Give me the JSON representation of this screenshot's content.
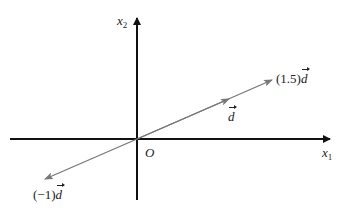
{
  "diagram": {
    "colors": {
      "axis": "#111111",
      "vector": "#777777",
      "text": "#222222"
    },
    "origin": {
      "px": [
        137,
        139
      ],
      "label": "O"
    },
    "axes": [
      {
        "name": "x1",
        "label_base": "x",
        "label_sub": "1",
        "direction": "horizontal"
      },
      {
        "name": "x2",
        "label_base": "x",
        "label_sub": "2",
        "direction": "vertical"
      }
    ],
    "vectors": [
      {
        "name": "d",
        "scalar": 1,
        "label_prefix": "",
        "label_vec": "d"
      },
      {
        "name": "1.5d",
        "scalar": 1.5,
        "label_prefix": "(1.5)",
        "label_vec": "d"
      },
      {
        "name": "-1d",
        "scalar": -1,
        "label_prefix": "(−1)",
        "label_vec": "d"
      }
    ]
  }
}
